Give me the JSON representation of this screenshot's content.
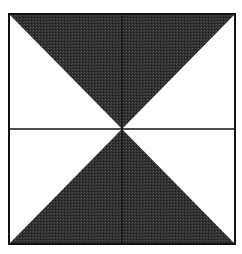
{
  "diagram": {
    "shaded_regions": [
      "top-triangle",
      "bottom-triangle"
    ],
    "unshaded_regions": [
      "left-triangle",
      "right-triangle"
    ],
    "colors": {
      "shade": "#2e2e2e",
      "line": "#111111",
      "background": "#ffffff"
    }
  }
}
